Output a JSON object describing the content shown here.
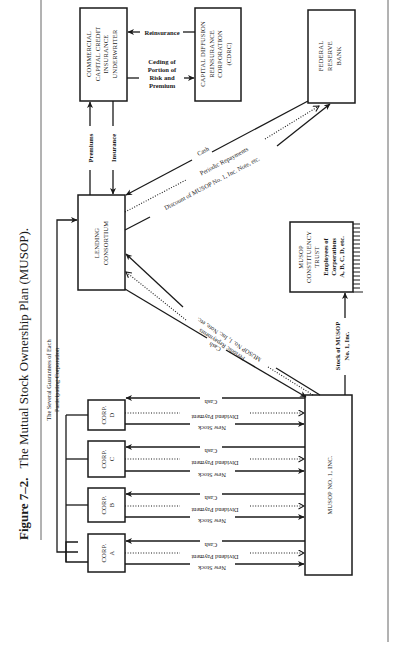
{
  "figure": {
    "label": "Figure 7–2.",
    "title": "The Mutual Stock Ownership Plan (MUSOP)."
  },
  "nodes": {
    "underwriter": [
      "COMMERCIAL",
      "CAPITAL CREDIT",
      "INSURANCE",
      "UNDERWRITER"
    ],
    "cdrc": [
      "CAPITAL DIFFUSION",
      "REINSURANCE",
      "CORPORATION",
      "(CDRC)"
    ],
    "fed": [
      "FEDERAL",
      "RESERVE",
      "BANK"
    ],
    "lending": [
      "LENDING",
      "CONSORTIUM"
    ],
    "trust": [
      "MUSOP",
      "CONSTITUENCY",
      "TRUST",
      "Employees of",
      "Corporations",
      "A, B, C, D, etc."
    ],
    "musop": "MUSOP NO. 1, INC.",
    "corps": [
      {
        "name": "CORP.",
        "letter": "A"
      },
      {
        "name": "CORP.",
        "letter": "B"
      },
      {
        "name": "CORP.",
        "letter": "C"
      },
      {
        "name": "CORP.",
        "letter": "D"
      }
    ]
  },
  "edges": {
    "reinsurance": "Reinsurance",
    "ceding": [
      "Ceding of",
      "Portion of",
      "Risk and",
      "Premium"
    ],
    "premiums": "Premiums",
    "insurance": "Insurance",
    "fed_cash": "Cash",
    "fed_repay": "Periodic Repayments",
    "fed_discount": "Discount of MUSOP No. 1, Inc. Note, etc.",
    "lend_note": "MUSOP No. 1, Inc. Note, etc.",
    "lend_repay": "Periodic Repayments",
    "lend_cash": "Cash",
    "guarantees": [
      "The Several Guarantees of Each",
      "Participating Corporation"
    ],
    "stock_musop": [
      "Stock of MUSOP",
      "No. 1, Inc."
    ],
    "corp_cash": "Cash",
    "corp_dividend": "Dividend Payment",
    "corp_newstock": "New Stock"
  }
}
